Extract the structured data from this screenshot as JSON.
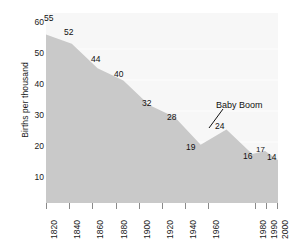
{
  "chart_data": {
    "type": "area",
    "title": "",
    "xlabel": "",
    "ylabel": "Births per thousand",
    "x": [
      1820,
      1840,
      1860,
      1880,
      1900,
      1920,
      1940,
      1960,
      1980,
      1990,
      2000
    ],
    "values": [
      55,
      52,
      44,
      40,
      32,
      28,
      19,
      24,
      16,
      17,
      14
    ],
    "categories": [
      "1820",
      "1840",
      "1860",
      "1880",
      "1900",
      "1920",
      "1940",
      "1960",
      "1980",
      "1990",
      "2000"
    ],
    "xlim": [
      1820,
      2000
    ],
    "ylim": [
      0,
      62
    ],
    "y_ticks": [
      10,
      20,
      30,
      40,
      50,
      60
    ],
    "y_tick_labels": [
      "10",
      "20",
      "30",
      "40",
      "50",
      "60"
    ],
    "x_tick_labels": [
      "1820",
      "1840",
      "1860",
      "1880",
      "1900",
      "1920",
      "1940",
      "1960",
      "1980",
      "1990",
      "2000"
    ],
    "grid": "horizontal-faint",
    "legend": "none",
    "series": [
      {
        "name": "Births per thousand",
        "values": [
          55,
          52,
          44,
          40,
          32,
          28,
          19,
          24,
          16,
          17,
          14
        ],
        "fill_color": "#c9c9c9",
        "area_background": "#f7f7f7"
      }
    ],
    "point_labels": [
      "55",
      "52",
      "44",
      "40",
      "32",
      "28",
      "19",
      "24",
      "16",
      "17",
      "14"
    ],
    "annotations": [
      {
        "text": "Baby Boom",
        "points_to_year": 1960,
        "points_to_value": 24
      }
    ]
  },
  "axes": {
    "y_title": "Births per thousand",
    "y_tick_labels": [
      "60",
      "50",
      "40",
      "30",
      "20",
      "10"
    ],
    "x_tick_labels": [
      "1820",
      "1840",
      "1860",
      "1880",
      "1900",
      "1920",
      "1940",
      "1960",
      "1980",
      "1990",
      "2000"
    ]
  },
  "labels": {
    "p1820": "55",
    "p1840": "52",
    "p1860": "44",
    "p1880": "40",
    "p1900": "32",
    "p1920": "28",
    "p1940": "19",
    "p1960": "24",
    "p1980": "16",
    "p1990": "17",
    "p2000": "14"
  },
  "annotation": {
    "baby_boom": "Baby Boom"
  },
  "colors": {
    "area_fill": "#c9c9c9",
    "plot_background": "#f7f7f7",
    "gridline": "#ffffff",
    "text": "#111111",
    "tick": "#8a8a8a"
  }
}
